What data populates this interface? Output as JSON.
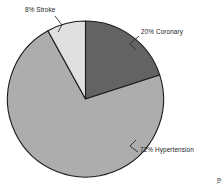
{
  "chart_data": {
    "type": "pie",
    "title": "",
    "subtitle": "",
    "xlabel": "",
    "ylabel": "",
    "legend_position": "none",
    "grid": false,
    "categories": [
      "Coronary",
      "Hypertension",
      "Stroke"
    ],
    "values": [
      20,
      72,
      8
    ],
    "unit": "%",
    "start_angle_deg": 0,
    "direction": "clockwise",
    "slices": [
      {
        "name": "Coronary",
        "value": 20,
        "label": "20% Coronary",
        "color": "#636363",
        "start_deg": 0,
        "end_deg": 72
      },
      {
        "name": "Hypertension",
        "value": 72,
        "label": "72% Hypertension",
        "color": "#adadad",
        "start_deg": 72,
        "end_deg": 331.2
      },
      {
        "name": "Stroke",
        "value": 8,
        "label": "8% Stroke",
        "color": "#e0e0e0",
        "start_deg": 331.2,
        "end_deg": 360
      }
    ],
    "annotations": [
      "8% Stroke",
      "20% Coronary",
      "72% Hypertension"
    ]
  },
  "figure": {
    "background_color": "#ffffff",
    "outline_color": "#1a1a1a",
    "credit": "© Cengage Learning"
  },
  "labels": {
    "stroke": "8% Stroke",
    "coronary": "20% Coronary",
    "hypertension": "72% Hypertension"
  }
}
